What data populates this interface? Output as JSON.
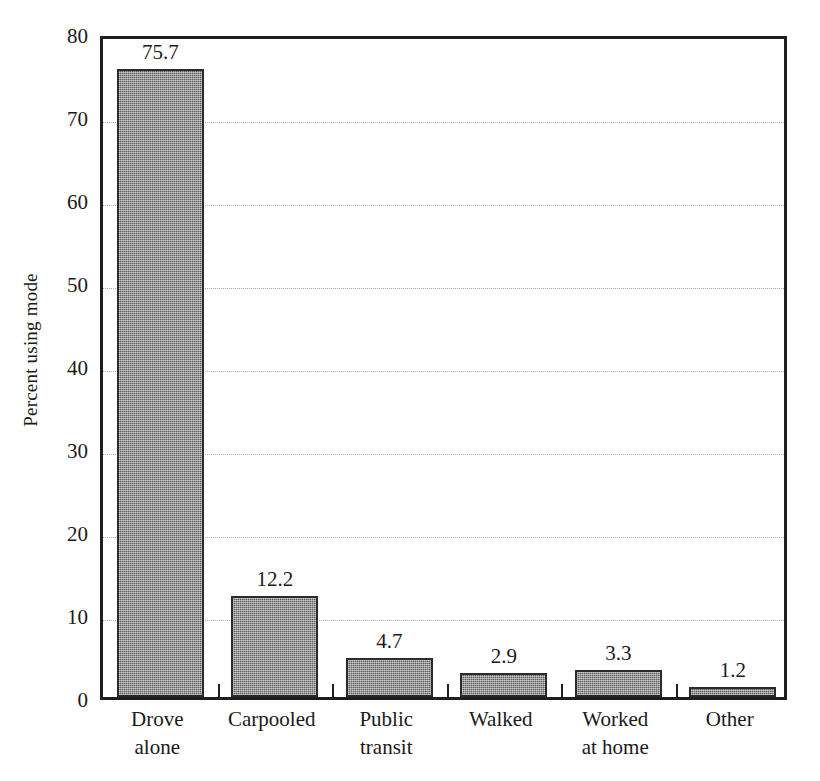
{
  "chart_data": {
    "type": "bar",
    "title": "",
    "subtitle": "",
    "xlabel": "",
    "ylabel": "Percent using mode",
    "categories": [
      "Drove alone",
      "Carpooled",
      "Public transit",
      "Walked",
      "Worked at home",
      "Other"
    ],
    "category_lines": [
      [
        "Drove",
        "alone"
      ],
      [
        "Carpooled",
        ""
      ],
      [
        "Public",
        "transit"
      ],
      [
        "Walked",
        ""
      ],
      [
        "Worked",
        "at home"
      ],
      [
        "Other",
        ""
      ]
    ],
    "values": [
      75.7,
      12.2,
      4.7,
      2.9,
      3.3,
      1.2
    ],
    "value_labels": [
      "75.7",
      "12.2",
      "4.7",
      "2.9",
      "3.3",
      "1.2"
    ],
    "ylim": [
      0,
      80
    ],
    "yticks": [
      0,
      10,
      20,
      30,
      40,
      50,
      60,
      70,
      80
    ],
    "ytick_labels": [
      "0",
      "10",
      "20",
      "30",
      "40",
      "50",
      "60",
      "70",
      "80"
    ],
    "grid": true,
    "grid_axis": "y",
    "legend": false,
    "legend_position": "none",
    "bar_color": "#787878",
    "bar_edge_color": "#2a2a2a",
    "grid_color": "#a9a9a9",
    "axis_color": "#1f1f1f",
    "text_color": "#1a1a1a",
    "background_color": "#ffffff"
  }
}
